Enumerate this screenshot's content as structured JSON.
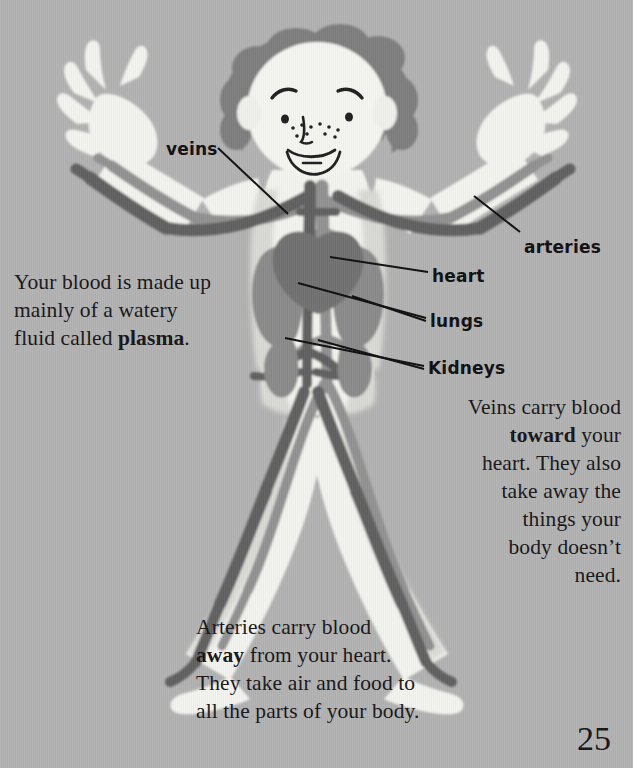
{
  "page": {
    "number": "25",
    "background_color": "#b2b2b2",
    "text_color": "#141414"
  },
  "illustration": {
    "name": "child-circulatory-system",
    "description": "Cartoon child standing with arms raised and legs apart, showing the circulatory system with heart, lungs, kidneys, veins and arteries",
    "colors": {
      "body": "#f4f4f0",
      "body_shadow": "#d8d8d4",
      "hair": "#7d7d7d",
      "vein": "#5e5e5e",
      "artery": "#909090",
      "organ": "#878787",
      "heart": "#6f6f6f",
      "outline": "#1a1a1a"
    }
  },
  "labels": [
    {
      "id": "veins",
      "text": "veins"
    },
    {
      "id": "arteries",
      "text": "arteries"
    },
    {
      "id": "heart",
      "text": "heart"
    },
    {
      "id": "lungs",
      "text": "lungs"
    },
    {
      "id": "kidneys",
      "text": "Kidneys"
    }
  ],
  "body_text": {
    "plasma": {
      "line1": "Your blood is made up",
      "line2": "mainly of a watery",
      "line3_prefix": "fluid called ",
      "line3_bold": "plasma",
      "line3_suffix": "."
    },
    "veins": {
      "line1": "Veins carry blood",
      "line2_bold": "toward",
      "line2_suffix": " your",
      "line3": "heart. They also",
      "line4": "take away the",
      "line5": "things your",
      "line6": "body doesn’t",
      "line7": "need."
    },
    "arteries": {
      "line1": "Arteries carry blood",
      "line2_bold": "away",
      "line2_suffix": " from your heart.",
      "line3": "They take air and food to",
      "line4": "all the parts of your body."
    }
  }
}
